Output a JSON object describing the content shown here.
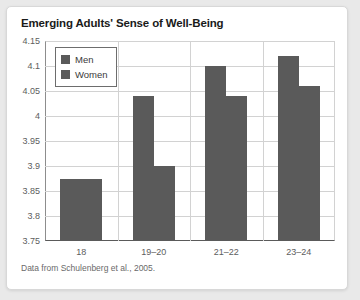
{
  "card": {
    "title": "Emerging Adults' Sense of Well-Being",
    "source_note": "Data from Schulenberg et al., 2005."
  },
  "legend": {
    "position": "top-left-inside",
    "entries": [
      {
        "label": "Men",
        "color": "#5a5a5a"
      },
      {
        "label": "Women",
        "color": "#5a5a5a"
      }
    ]
  },
  "colors": {
    "bar_fill": "#5a5a5a",
    "grid": "#d2d2d2",
    "axis": "#5a5a5a",
    "tick_text": "#5d5d5d",
    "title_text": "#1a1a1a",
    "source_text": "#6a6a6a",
    "card_bg": "#ffffff",
    "page_bg": "#e9e9e9"
  },
  "chart_data": {
    "type": "bar",
    "title": "Emerging Adults' Sense of Well-Being",
    "subtitle": "",
    "xlabel": "",
    "ylabel": "",
    "categories": [
      "18",
      "19–20",
      "21–22",
      "23–24"
    ],
    "series": [
      {
        "name": "Men",
        "values": [
          3.875,
          4.04,
          4.1,
          4.12
        ]
      },
      {
        "name": "Women",
        "values": [
          3.875,
          3.9,
          4.04,
          4.06
        ]
      }
    ],
    "ylim": [
      3.75,
      4.15
    ],
    "yticks": [
      "3.75",
      "3.8",
      "3.85",
      "3.9",
      "3.95",
      "4",
      "4.05",
      "4.1",
      "4.15"
    ],
    "ytick_values": [
      3.75,
      3.8,
      3.85,
      3.9,
      3.95,
      4.0,
      4.05,
      4.1,
      4.15
    ],
    "grid": true,
    "legend_position": "top-left",
    "annotations": [
      "Data from Schulenberg et al., 2005."
    ]
  }
}
